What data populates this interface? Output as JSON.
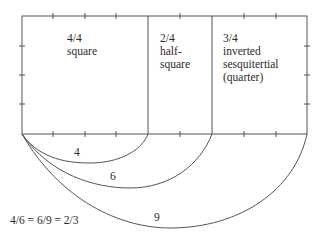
{
  "regions": [
    {
      "ratio": "4/4",
      "name": "square"
    },
    {
      "ratio": "2/4",
      "name": "half-\nsquare",
      "line1": "half-",
      "line2": "square"
    },
    {
      "ratio": "3/4",
      "line1": "inverted",
      "line2": "sesquitertial",
      "line3": "(quarter)"
    }
  ],
  "arcs": [
    {
      "label": "4"
    },
    {
      "label": "6"
    },
    {
      "label": "9"
    }
  ],
  "equation": "4/6 = 6/9 = 2/3",
  "colors": {
    "line": "#555555",
    "text": "#2a2a2a"
  }
}
